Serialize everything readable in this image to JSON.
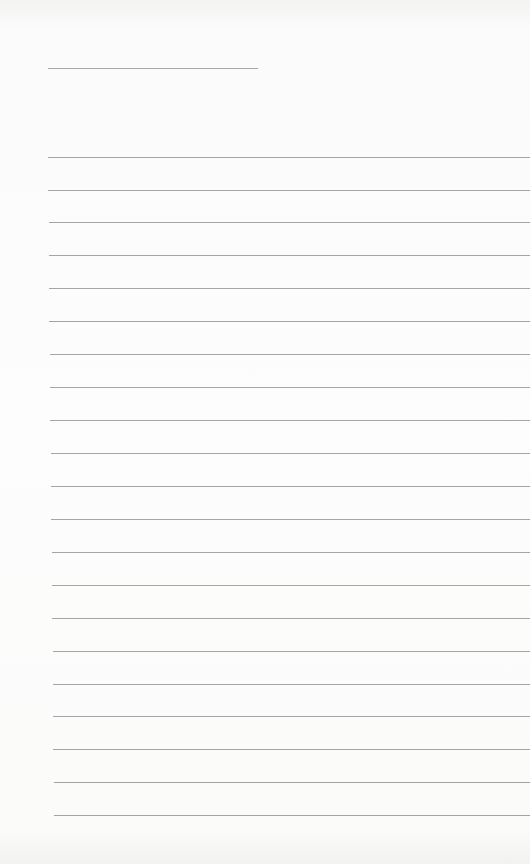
{
  "page": {
    "type": "lined-paper",
    "background_color": "#fcfcfc",
    "line_color": "#8f8f8f"
  },
  "header_line": {
    "x": 48,
    "y": 68,
    "width": 210
  },
  "rules": [
    {
      "x": 48,
      "y": 157
    },
    {
      "x": 48,
      "y": 190
    },
    {
      "x": 49,
      "y": 222
    },
    {
      "x": 49,
      "y": 255
    },
    {
      "x": 49,
      "y": 288
    },
    {
      "x": 49,
      "y": 321
    },
    {
      "x": 50,
      "y": 354
    },
    {
      "x": 50,
      "y": 387
    },
    {
      "x": 50,
      "y": 420
    },
    {
      "x": 51,
      "y": 453
    },
    {
      "x": 51,
      "y": 486
    },
    {
      "x": 51,
      "y": 519
    },
    {
      "x": 52,
      "y": 552
    },
    {
      "x": 52,
      "y": 585
    },
    {
      "x": 52,
      "y": 618
    },
    {
      "x": 53,
      "y": 651
    },
    {
      "x": 53,
      "y": 684
    },
    {
      "x": 53,
      "y": 716
    },
    {
      "x": 53,
      "y": 749
    },
    {
      "x": 54,
      "y": 782
    },
    {
      "x": 54,
      "y": 815
    }
  ]
}
